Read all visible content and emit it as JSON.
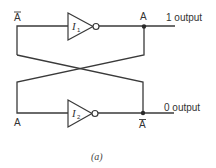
{
  "diagram": {
    "caption": "(a)",
    "gates": [
      {
        "id": "I1",
        "letter": "I",
        "subscript": "1",
        "type": "inverter"
      },
      {
        "id": "I2",
        "letter": "I",
        "subscript": "2",
        "type": "inverter"
      }
    ],
    "labels": {
      "top_input": "A",
      "top_input_overbar": true,
      "top_output_node": "A",
      "top_output": "1 output",
      "bottom_input": "A",
      "bottom_output_node": "A",
      "bottom_output_node_overbar": true,
      "bottom_output": "0 output"
    },
    "colors": {
      "line": "#3a3a3a",
      "text": "#333333",
      "background": "#ffffff"
    }
  }
}
